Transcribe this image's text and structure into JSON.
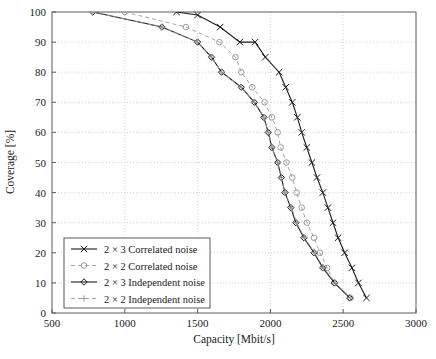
{
  "chart_data": {
    "type": "line",
    "title": "",
    "xlabel": "Capacity [Mbit/s]",
    "ylabel": "Coverage [%]",
    "xlim": [
      500,
      3000
    ],
    "ylim": [
      0,
      100
    ],
    "xticks": [
      500,
      1000,
      1500,
      2000,
      2500,
      3000
    ],
    "yticks": [
      0,
      10,
      20,
      30,
      40,
      50,
      60,
      70,
      80,
      90,
      100
    ],
    "xtick_labels": [
      "500",
      "1000",
      "1500",
      "2000",
      "2500",
      "3000"
    ],
    "ytick_labels": [
      "0",
      "10",
      "20",
      "30",
      "40",
      "50",
      "60",
      "70",
      "80",
      "90",
      "100"
    ],
    "grid": true,
    "grid_style": "dotted",
    "legend_position": "lower-left",
    "series": [
      {
        "name": "2 × 3 Correlated noise",
        "marker": "x",
        "linestyle": "solid",
        "color": "#1a1a1a",
        "points": [
          [
            1355,
            100
          ],
          [
            1500,
            99
          ],
          [
            1655,
            95
          ],
          [
            1790,
            90
          ],
          [
            1895,
            90
          ],
          [
            1965,
            85
          ],
          [
            2060,
            80
          ],
          [
            2105,
            75
          ],
          [
            2150,
            70
          ],
          [
            2185,
            65
          ],
          [
            2215,
            60
          ],
          [
            2250,
            55
          ],
          [
            2285,
            50
          ],
          [
            2320,
            45
          ],
          [
            2360,
            40
          ],
          [
            2395,
            35
          ],
          [
            2430,
            30
          ],
          [
            2465,
            25
          ],
          [
            2510,
            20
          ],
          [
            2560,
            15
          ],
          [
            2605,
            10
          ],
          [
            2660,
            5
          ]
        ]
      },
      {
        "name": "2 × 2 Correlated noise",
        "marker": "o",
        "linestyle": "dashed",
        "color": "#9a9a9a",
        "points": [
          [
            1000,
            100
          ],
          [
            1420,
            95
          ],
          [
            1650,
            90
          ],
          [
            1760,
            85
          ],
          [
            1800,
            80
          ],
          [
            1875,
            75
          ],
          [
            1960,
            70
          ],
          [
            2010,
            65
          ],
          [
            2050,
            60
          ],
          [
            2070,
            55
          ],
          [
            2110,
            50
          ],
          [
            2150,
            45
          ],
          [
            2180,
            40
          ],
          [
            2215,
            35
          ],
          [
            2250,
            30
          ],
          [
            2300,
            25
          ],
          [
            2340,
            20
          ],
          [
            2390,
            15
          ],
          [
            2440,
            10
          ],
          [
            2550,
            5
          ]
        ]
      },
      {
        "name": "2 × 3 Independent noise",
        "marker": "d",
        "linestyle": "solid",
        "color": "#1a1a1a",
        "points": [
          [
            780,
            100
          ],
          [
            1255,
            95
          ],
          [
            1500,
            90
          ],
          [
            1595,
            85
          ],
          [
            1665,
            80
          ],
          [
            1800,
            75
          ],
          [
            1890,
            70
          ],
          [
            1955,
            65
          ],
          [
            1985,
            60
          ],
          [
            2010,
            55
          ],
          [
            2050,
            50
          ],
          [
            2075,
            45
          ],
          [
            2100,
            40
          ],
          [
            2140,
            35
          ],
          [
            2175,
            30
          ],
          [
            2230,
            25
          ],
          [
            2300,
            20
          ],
          [
            2360,
            15
          ],
          [
            2440,
            10
          ],
          [
            2545,
            5
          ]
        ]
      },
      {
        "name": "2 × 2 Independent noise",
        "marker": "+",
        "linestyle": "dashed",
        "color": "#9a9a9a",
        "points": [
          [
            780,
            100
          ],
          [
            1255,
            95
          ],
          [
            1500,
            90
          ],
          [
            1595,
            85
          ],
          [
            1665,
            80
          ],
          [
            1800,
            75
          ],
          [
            1890,
            70
          ],
          [
            1955,
            65
          ],
          [
            1985,
            60
          ],
          [
            2010,
            55
          ],
          [
            2050,
            50
          ],
          [
            2075,
            45
          ],
          [
            2100,
            40
          ],
          [
            2145,
            35
          ],
          [
            2180,
            30
          ],
          [
            2235,
            25
          ],
          [
            2305,
            20
          ],
          [
            2365,
            15
          ],
          [
            2445,
            10
          ],
          [
            2550,
            5
          ]
        ]
      }
    ],
    "legend_entries": [
      "2 × 3 Correlated noise",
      "2 × 2 Correlated noise",
      "2 × 3 Independent noise",
      "2 × 2 Independent noise"
    ]
  },
  "colors": {
    "axis": "#5a5a5a",
    "grid": "#c8c8c8",
    "dark_series": "#1a1a1a",
    "light_series": "#9a9a9a",
    "background": "#ffffff",
    "text": "#1a1a1a"
  }
}
